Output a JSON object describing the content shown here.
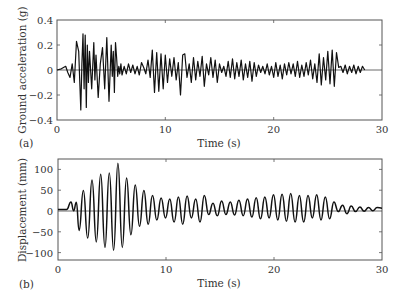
{
  "chart_data": [
    {
      "type": "line",
      "panel_label": "(a)",
      "title": "",
      "xlabel": "Time (s)",
      "ylabel": "Ground acceleration (g)",
      "xlim": [
        0,
        30
      ],
      "ylim": [
        -0.4,
        0.4
      ],
      "xticks": [
        "0",
        "10",
        "20",
        "30"
      ],
      "yticks": [
        "0.4",
        "0.2",
        "0",
        "−0.2",
        "−0.4"
      ],
      "grid": false,
      "zero_line": true,
      "series": [
        {
          "name": "Ground acceleration",
          "x": [
            0,
            0.4,
            0.8,
            1.0,
            1.2,
            1.4,
            1.6,
            1.8,
            2.0,
            2.1,
            2.2,
            2.3,
            2.4,
            2.5,
            2.6,
            2.7,
            2.8,
            2.9,
            3.0,
            3.2,
            3.4,
            3.5,
            3.6,
            3.8,
            4.0,
            4.2,
            4.4,
            4.6,
            4.8,
            5.0,
            5.1,
            5.2,
            5.3,
            5.4,
            5.5,
            5.6,
            5.7,
            5.8,
            5.9,
            6.0,
            6.2,
            6.4,
            6.6,
            6.8,
            7.0,
            7.2,
            7.4,
            7.6,
            7.8,
            8.0,
            8.2,
            8.4,
            8.6,
            8.8,
            9.0,
            9.2,
            9.4,
            9.6,
            9.8,
            10.0,
            10.2,
            10.4,
            10.6,
            10.8,
            11.0,
            11.2,
            11.4,
            11.6,
            11.8,
            12.0,
            12.2,
            12.4,
            12.6,
            12.8,
            13.0,
            13.2,
            13.4,
            13.6,
            13.8,
            14.0,
            14.2,
            14.4,
            14.6,
            14.8,
            15.0,
            15.2,
            15.4,
            15.6,
            15.8,
            16.0,
            16.2,
            16.4,
            16.6,
            16.8,
            17.0,
            17.2,
            17.4,
            17.6,
            17.8,
            18.0,
            18.2,
            18.4,
            18.6,
            18.8,
            19.0,
            19.2,
            19.4,
            19.6,
            19.8,
            20.0,
            20.2,
            20.4,
            20.6,
            20.8,
            21.0,
            21.2,
            21.4,
            21.6,
            21.8,
            22.0,
            22.2,
            22.4,
            22.6,
            22.8,
            23.0,
            23.2,
            23.4,
            23.6,
            23.8,
            24.0,
            24.2,
            24.4,
            24.6,
            24.8,
            25.0,
            25.2,
            25.4,
            25.6,
            25.8,
            26.0,
            26.2,
            26.4,
            26.6,
            26.8,
            27.0,
            27.2,
            27.4,
            27.6,
            27.8,
            28.0,
            28.2,
            28.4,
            28.6,
            28.8,
            29.0,
            29.2
          ],
          "values": [
            0,
            0.01,
            0.03,
            -0.02,
            -0.06,
            0.05,
            -0.1,
            0.23,
            0.15,
            -0.1,
            -0.32,
            0.05,
            0.29,
            -0.15,
            0.28,
            -0.3,
            0.2,
            -0.1,
            0.15,
            -0.15,
            0.22,
            -0.08,
            0.12,
            -0.22,
            0.05,
            0.18,
            -0.15,
            0.26,
            -0.25,
            0.2,
            -0.05,
            0.15,
            -0.18,
            0.22,
            0.1,
            -0.05,
            0.03,
            -0.03,
            0.05,
            -0.04,
            0.03,
            -0.03,
            0.05,
            -0.02,
            0.04,
            -0.03,
            0.03,
            -0.04,
            0.06,
            0.02,
            -0.03,
            0.08,
            -0.06,
            0.16,
            -0.18,
            0.14,
            -0.17,
            0.13,
            -0.15,
            0.12,
            -0.1,
            0.09,
            -0.05,
            0.1,
            -0.08,
            0.06,
            -0.2,
            0.12,
            0.13,
            -0.06,
            0.05,
            -0.1,
            0.1,
            -0.08,
            0.07,
            -0.05,
            0.11,
            -0.13,
            0.05,
            -0.04,
            0.1,
            -0.06,
            0.08,
            -0.1,
            0.05,
            -0.02,
            0.03,
            -0.05,
            0.07,
            -0.06,
            0.09,
            -0.07,
            0.06,
            -0.05,
            0.08,
            -0.08,
            0.05,
            -0.06,
            0.07,
            -0.09,
            0.06,
            -0.05,
            0.04,
            -0.02,
            0.03,
            -0.03,
            0.05,
            -0.04,
            0.03,
            -0.06,
            0.06,
            -0.05,
            0.04,
            -0.07,
            0.05,
            -0.04,
            0.06,
            -0.03,
            0.05,
            -0.05,
            0.07,
            -0.06,
            0.04,
            -0.05,
            0.06,
            -0.04,
            0.08,
            -0.07,
            0.05,
            -0.1,
            0.13,
            -0.12,
            0.1,
            -0.08,
            0.15,
            -0.11,
            0.16,
            -0.13,
            0.14,
            0.02,
            0.03,
            -0.02,
            0.04,
            -0.03,
            0.03,
            -0.02,
            0.04,
            -0.03,
            0.03,
            -0.02,
            0.03,
            0
          ]
        }
      ]
    },
    {
      "type": "line",
      "panel_label": "(b)",
      "title": "",
      "xlabel": "Time (s)",
      "ylabel": "Displacement (mm)",
      "xlim": [
        0,
        30
      ],
      "ylim": [
        -120,
        120
      ],
      "xticks": [
        "0",
        "10",
        "20",
        "30"
      ],
      "yticks": [
        "100",
        "50",
        "0",
        "−50",
        "−100"
      ],
      "grid": false,
      "zero_line": true,
      "series": [
        {
          "name": "Displacement",
          "x": [
            0,
            0.8,
            1.2,
            1.45,
            1.7,
            1.95,
            2.35,
            2.75,
            3.15,
            3.55,
            3.95,
            4.35,
            4.75,
            5.15,
            5.55,
            5.95,
            6.35,
            6.75,
            7.15,
            7.55,
            7.95,
            8.35,
            8.75,
            9.15,
            9.55,
            9.95,
            10.35,
            10.75,
            11.15,
            11.55,
            11.95,
            12.35,
            12.75,
            13.15,
            13.55,
            13.95,
            14.35,
            14.75,
            15.15,
            15.55,
            15.95,
            16.35,
            16.75,
            17.15,
            17.55,
            17.95,
            18.35,
            18.75,
            19.15,
            19.55,
            19.95,
            20.35,
            20.75,
            21.15,
            21.55,
            21.95,
            22.35,
            22.75,
            23.15,
            23.55,
            23.95,
            24.35,
            24.75,
            25.15,
            25.55,
            25.95,
            26.35,
            26.75,
            27.15,
            27.55,
            27.95,
            28.35,
            28.75,
            29.15,
            29.55,
            30
          ],
          "values": [
            0,
            0,
            18,
            -3,
            17,
            -50,
            45,
            -68,
            70,
            -77,
            84,
            -90,
            87,
            -97,
            110,
            -90,
            75,
            -60,
            58,
            -40,
            45,
            -35,
            33,
            -25,
            27,
            -20,
            25,
            -30,
            30,
            -35,
            32,
            -20,
            25,
            -30,
            33,
            -12,
            15,
            -15,
            20,
            -12,
            18,
            -13,
            22,
            -15,
            25,
            -18,
            28,
            -22,
            30,
            -20,
            35,
            -25,
            36,
            -28,
            38,
            -30,
            33,
            -30,
            33,
            -20,
            35,
            -25,
            30,
            -22,
            18,
            -5,
            10,
            -10,
            8,
            -5,
            6,
            -4,
            5,
            -3,
            5,
            3
          ]
        }
      ]
    }
  ],
  "panel_a": {
    "label": "(a)",
    "xlabel": "Time (s)",
    "ylabel": "Ground acceleration (g)",
    "xticks": [
      "0",
      "10",
      "20",
      "30"
    ],
    "yticks": [
      "0.4",
      "0.2",
      "0",
      "−0.2",
      "−0.4"
    ]
  },
  "panel_b": {
    "label": "(b)",
    "xlabel": "Time (s)",
    "ylabel": "Displacement (mm)",
    "xticks": [
      "0",
      "10",
      "20",
      "30"
    ],
    "yticks": [
      "100",
      "50",
      "0",
      "−50",
      "−100"
    ]
  },
  "colors": {
    "line": "#111111",
    "axis": "#555555"
  }
}
